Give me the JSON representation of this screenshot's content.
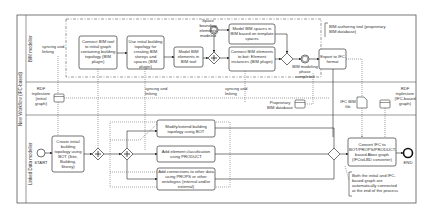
{
  "pool": {
    "label": "New Workflow (IFC-based)"
  },
  "lanes": [
    {
      "label": "BIM modeller"
    },
    {
      "label": "Linked Data modeller"
    }
  ],
  "annotations": {
    "bim_tool": "BIM authoring tool (proprietary BIM database)",
    "final_note": "Both the initial and IFC-based graph are automatically connected at the end of the process",
    "syncing_1": "syncing and linking",
    "syncing_2": "syncing and linking",
    "syncing_3": "syncing and linking"
  },
  "events": {
    "start": "START",
    "end": "END",
    "space_bounding": "Space bounding elements modeled",
    "bim_phase": "BIM modeling phase completed"
  },
  "tasks": {
    "connect_bim_tool": "Connect BIM tool to initial graph containing building topology (BIM plugin)",
    "use_initial_topology": "Use initial building topology for creating BIM storeys and spaces (BIM plugin)",
    "model_bim_elements": "Model BIM elements in BIM tool",
    "model_bim_spaces": "Model BIM spaces in BIM based on template spaces",
    "connect_bim_elements": "Connect BIM elements to bot: Element instances (BIM plugin)",
    "export_ifc": "Export to IFC format",
    "create_topology": "Create initial building topology using BOT (Site, Building, Storey)",
    "modify_topology": "Modify/extend building topology using BOT",
    "add_classification": "Add element classification using PRODUCT",
    "add_connections": "Add connections to other data using PROPS or other ontologies (internal and/or external)",
    "convert_ifc": "Convert IFC to BOT/PROPS/PRODUCT-based Abox graph (IFCtoLBD converter)"
  },
  "data_objects": {
    "rdf_initial": "RDF triplestore (initial graph)",
    "proprietary_db": "Proprietary BIM database",
    "ifc_file": "IFC BIM file",
    "rdf_ifc": "RDF triplestore (IFC-based graph)"
  }
}
